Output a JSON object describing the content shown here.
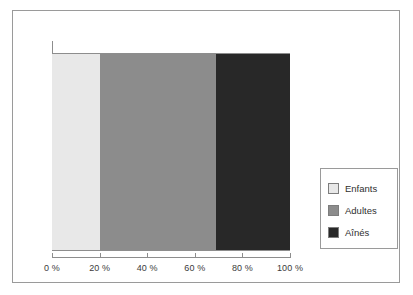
{
  "chart_data": {
    "type": "bar",
    "orientation": "horizontal",
    "stacked": true,
    "title": "",
    "subtitle": "",
    "xlabel": "",
    "ylabel": "",
    "categories": [
      ""
    ],
    "series": [
      {
        "name": "Enfants",
        "values": [
          20
        ],
        "color": "#e8e8e8"
      },
      {
        "name": "Adultes",
        "values": [
          49
        ],
        "color": "#8c8c8c"
      },
      {
        "name": "Aînés",
        "values": [
          31
        ],
        "color": "#282828"
      }
    ],
    "xlim": [
      0,
      100
    ],
    "x_ticks": [
      0,
      20,
      40,
      60,
      80,
      100
    ],
    "x_tick_labels": [
      "0 %",
      "20 %",
      "40 %",
      "60 %",
      "80 %",
      "100 %"
    ],
    "grid": false,
    "legend_position": "right"
  },
  "axis": {
    "ticks": [
      {
        "label": "0 %",
        "value": 0
      },
      {
        "label": "20 %",
        "value": 20
      },
      {
        "label": "40 %",
        "value": 40
      },
      {
        "label": "60 %",
        "value": 60
      },
      {
        "label": "80 %",
        "value": 80
      },
      {
        "label": "100 %",
        "value": 100
      }
    ]
  },
  "legend": {
    "items": [
      {
        "label": "Enfants",
        "color": "#e8e8e8"
      },
      {
        "label": "Adultes",
        "color": "#8c8c8c"
      },
      {
        "label": "Aînés",
        "color": "#282828"
      }
    ]
  },
  "colors": {
    "frame": "#9a9a9a",
    "axis": "#8d8d8d",
    "text": "#3b3b3b",
    "background": "#ffffff"
  }
}
